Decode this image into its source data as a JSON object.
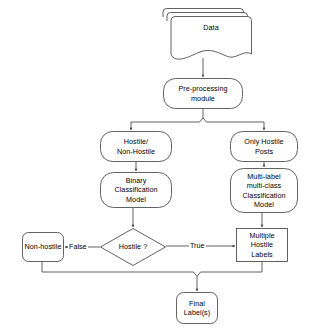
{
  "diagram": {
    "stroke_color": "#3a3a3a",
    "fill_color": "#ffffff",
    "text_color": "#000000",
    "nodes": [
      {
        "id": "data",
        "label": "Data",
        "shape": "multi-document",
        "x": 163,
        "y": 11,
        "w": 84,
        "h": 49
      },
      {
        "id": "preprocessing",
        "label": "Pre-processing\nmodule",
        "shape": "rounded-rect",
        "x": 163,
        "y": 78,
        "w": 80,
        "h": 31
      },
      {
        "id": "hostile-nonhostile",
        "label": "Hostile/\nNon-Hostile",
        "shape": "rounded-rect",
        "x": 100,
        "y": 131,
        "w": 72,
        "h": 31
      },
      {
        "id": "only-hostile-posts",
        "label": "Only Hostile\nPosts",
        "shape": "rounded-rect",
        "x": 230,
        "y": 131,
        "w": 68,
        "h": 31
      },
      {
        "id": "binary-model",
        "label": "Binary\nClassification\nModel",
        "shape": "rounded-rect",
        "x": 100,
        "y": 172,
        "w": 72,
        "h": 36
      },
      {
        "id": "multilabel-model",
        "label": "Multi-label\nmulti-class\nClassification\nModel",
        "shape": "rounded-rect",
        "x": 230,
        "y": 168,
        "w": 68,
        "h": 45
      },
      {
        "id": "hostile-decision",
        "label": "Hostile ?",
        "shape": "diamond",
        "x": 100,
        "y": 228,
        "w": 66,
        "h": 38
      },
      {
        "id": "multiple-hostile-labels",
        "label": "Multiple\nHostile\nLabels",
        "shape": "rect",
        "x": 236,
        "y": 228,
        "w": 52,
        "h": 34
      },
      {
        "id": "non-hostile",
        "label": "Non-hostile",
        "shape": "rounded-rect",
        "x": 22,
        "y": 232,
        "w": 42,
        "h": 30
      },
      {
        "id": "final-labels",
        "label": "Final\nLabel(s)",
        "shape": "rounded-rect",
        "x": 176,
        "y": 292,
        "w": 42,
        "h": 32
      }
    ],
    "edge_labels": [
      {
        "id": "false-label",
        "text": "False",
        "x": 70,
        "y": 242
      },
      {
        "id": "true-label",
        "text": "True",
        "x": 190,
        "y": 242
      }
    ]
  }
}
